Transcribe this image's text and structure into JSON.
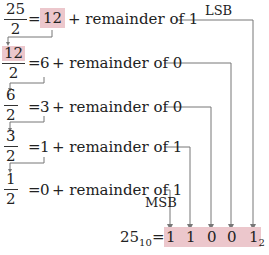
{
  "steps": [
    {
      "numerator": "25",
      "denominator": "2",
      "quotient": "12",
      "remainder_text": "+ remainder of 1"
    },
    {
      "numerator": "12",
      "denominator": "2",
      "quotient": "6",
      "remainder_text": "+ remainder of 0"
    },
    {
      "numerator": "6",
      "denominator": "2",
      "quotient": "3",
      "remainder_text": "+ remainder of 0"
    },
    {
      "numerator": "3",
      "denominator": "2",
      "quotient": "1",
      "remainder_text": "+ remainder of 1"
    },
    {
      "numerator": "1",
      "denominator": "2",
      "quotient": "0",
      "remainder_text": "+ remainder of 1"
    }
  ],
  "equals": "=",
  "labels": {
    "lsb": "LSB",
    "msb": "MSB"
  },
  "result": {
    "decimal": "25",
    "decimal_base": "10",
    "equals": "=",
    "bits": [
      "1",
      "1",
      "0",
      "0",
      "1"
    ],
    "binary_base": "2"
  },
  "colors": {
    "highlight": "#ecc7cc",
    "line": "#777777"
  }
}
